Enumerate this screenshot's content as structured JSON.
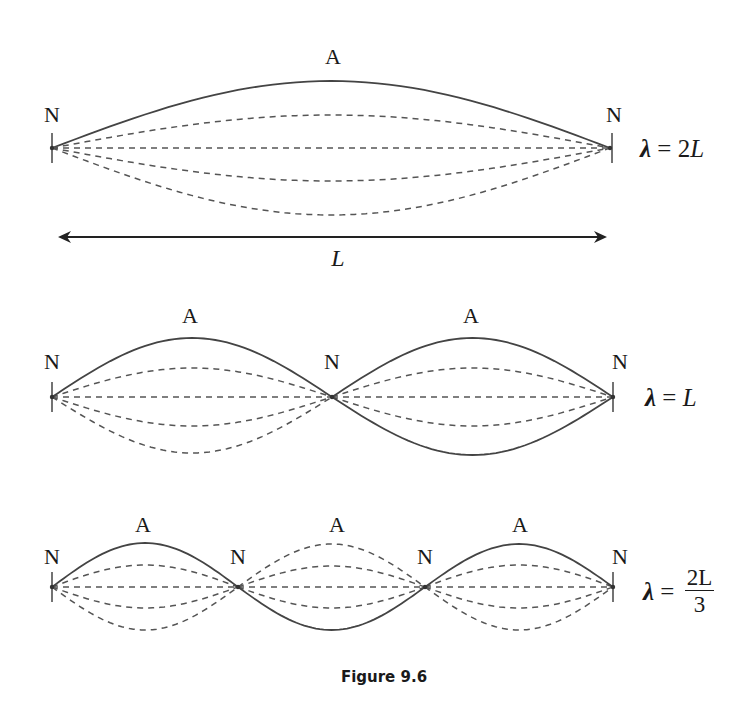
{
  "figure": {
    "caption": "Figure 9.6",
    "colors": {
      "solid": "#444444",
      "dashed": "#555555",
      "text": "#1a1a1a"
    }
  },
  "panels": [
    {
      "id": "fundamental",
      "baseline_y": 148,
      "x_start": 52,
      "x_end": 610,
      "nodes": [
        52,
        610
      ],
      "node_label": "N",
      "antinode_label": "A",
      "node_labels": [
        {
          "x": 52,
          "y": 104
        },
        {
          "x": 614,
          "y": 104
        }
      ],
      "antinode_labels": [
        {
          "x": 333,
          "y": 46
        }
      ],
      "solid_amplitudes": [
        67
      ],
      "dashed_amplitudes": [
        33,
        0,
        -33,
        -67
      ],
      "solid_sign": [
        1
      ],
      "equation": {
        "lambda": "λ",
        "equals": " = ",
        "rhs": "2",
        "rhs_italic": "L",
        "x": 640,
        "y": 136
      }
    },
    {
      "id": "second-harmonic",
      "baseline_y": 397,
      "x_start": 52,
      "x_end": 613,
      "nodes": [
        52,
        332,
        613
      ],
      "node_label": "N",
      "antinode_label": "A",
      "node_labels": [
        {
          "x": 52,
          "y": 351
        },
        {
          "x": 332,
          "y": 351
        },
        {
          "x": 620,
          "y": 351
        }
      ],
      "antinode_labels": [
        {
          "x": 190,
          "y": 305
        },
        {
          "x": 471,
          "y": 305
        }
      ],
      "lobes": [
        {
          "solid": [
            59
          ],
          "dashed": [
            29,
            0,
            -29,
            -56
          ]
        },
        {
          "solid": [
            59,
            -58
          ],
          "dashed": [
            29,
            0,
            -29
          ]
        }
      ],
      "equation": {
        "lambda": "λ",
        "equals": " = ",
        "rhs": "",
        "rhs_italic": "L",
        "x": 645,
        "y": 385
      }
    },
    {
      "id": "third-harmonic",
      "baseline_y": 587,
      "x_start": 52,
      "x_end": 613,
      "nodes": [
        52,
        238,
        425,
        613
      ],
      "node_label": "N",
      "antinode_label": "A",
      "node_labels": [
        {
          "x": 52,
          "y": 546
        },
        {
          "x": 238,
          "y": 546
        },
        {
          "x": 425,
          "y": 546
        },
        {
          "x": 620,
          "y": 546
        }
      ],
      "antinode_labels": [
        {
          "x": 143,
          "y": 514
        },
        {
          "x": 337,
          "y": 514
        },
        {
          "x": 520,
          "y": 514
        }
      ],
      "lobes": [
        {
          "solid": [
            44
          ],
          "dashed": [
            22,
            0,
            -21,
            -43
          ]
        },
        {
          "solid": [
            -43
          ],
          "dashed": [
            43,
            21,
            0,
            -21
          ]
        },
        {
          "solid": [
            43
          ],
          "dashed": [
            22,
            0,
            -21,
            -43
          ]
        }
      ],
      "equation": {
        "lambda": "λ",
        "equals": " = ",
        "numerator": "2L",
        "denominator": "3",
        "x": 643,
        "y": 566
      }
    }
  ],
  "length_arrow": {
    "label": "L",
    "x1": 58,
    "x2": 607,
    "y": 237,
    "label_x": 338,
    "label_y": 246
  }
}
